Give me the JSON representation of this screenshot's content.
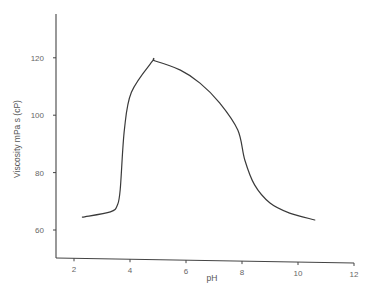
{
  "chart_data": {
    "type": "line",
    "title": "",
    "xlabel": "pH",
    "ylabel": "Viscosity mPa s (cP)",
    "xlim": [
      1.4,
      12
    ],
    "ylim": [
      50,
      140
    ],
    "xticks": [
      2,
      4,
      6,
      8,
      10,
      12
    ],
    "yticks": [
      60,
      80,
      100,
      120
    ],
    "xtick_labels": [
      "2",
      "4",
      "6",
      "8",
      "10",
      "12"
    ],
    "ytick_labels": [
      "60",
      "80",
      "100",
      "120"
    ],
    "grid": false,
    "legend": null,
    "series": [
      {
        "name": "Viscosity",
        "x": [
          2.3,
          3.3,
          3.55,
          3.65,
          3.8,
          4.05,
          4.8,
          4.9,
          5.8,
          6.5,
          7.2,
          7.85,
          8.1,
          8.45,
          9.0,
          9.7,
          10.6
        ],
        "y": [
          64.5,
          66.3,
          68.7,
          74,
          95,
          108,
          118.8,
          118.9,
          115.7,
          111.2,
          104.3,
          94.8,
          84.4,
          75.7,
          69.4,
          65.9,
          63.5
        ]
      }
    ]
  },
  "labels": {
    "x_axis": "pH",
    "y_axis": "Viscosity mPa s (cP)"
  },
  "colors": {
    "line": "#3a3a3a",
    "axis": "#444444",
    "text": "#666666"
  }
}
